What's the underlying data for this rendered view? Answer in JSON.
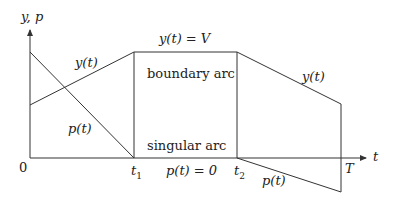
{
  "diagram": {
    "axes": {
      "y_label": "y, p",
      "x_label": "t",
      "origin_label": "0"
    },
    "ticks": {
      "t1": "t",
      "t1_sub": "1",
      "t2": "t",
      "t2_sub": "2",
      "T": "T"
    },
    "labels": {
      "y_rise": "y(t)",
      "y_fall": "y(t)",
      "p_fall": "p(t)",
      "p_neg": "p(t)",
      "boundary_eq": "y(t) = V",
      "boundary_arc": "boundary arc",
      "singular_arc": "singular arc",
      "p_zero": "p(t) = 0"
    },
    "colors": {
      "line": "#333333",
      "text": "#222222",
      "background": "#ffffff"
    },
    "curves": {
      "y": [
        [
          0,
          105
        ],
        [
          134,
          52
        ],
        [
          237,
          52
        ],
        [
          341,
          104
        ]
      ],
      "p": [
        [
          0,
          52
        ],
        [
          134,
          158
        ],
        [
          237,
          158
        ],
        [
          341,
          192
        ]
      ]
    }
  }
}
